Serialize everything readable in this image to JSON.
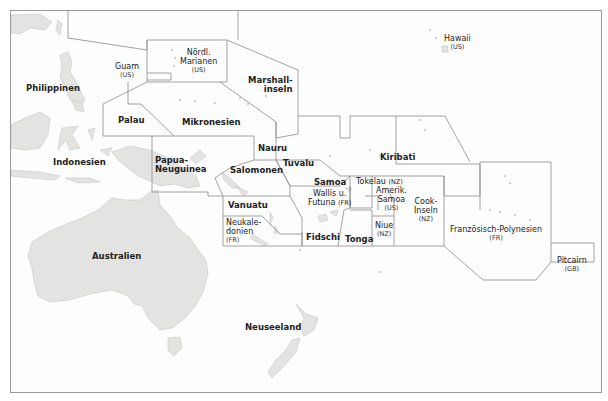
{
  "map": {
    "title": "Ozeanien",
    "colors": {
      "land": "#e3e3e1",
      "land_stroke": "#c8c8c6",
      "border": "#8c8c8c",
      "sea": "#fdfdfd",
      "text": "#222222"
    },
    "labels": {
      "hawaii": {
        "name": "Hawaii",
        "owner": "(US)"
      },
      "guam": {
        "name": "Guam",
        "owner": "(US)"
      },
      "marianen": {
        "name": "Nördl. Marianen",
        "line1": "Nördl.",
        "line2": "Marianen",
        "owner": "(US)"
      },
      "marshall": {
        "name": "Marshallinseln",
        "line1": "Marshall-",
        "line2": "inseln"
      },
      "philippinen": {
        "name": "Philippinen"
      },
      "palau": {
        "name": "Palau"
      },
      "mikronesien": {
        "name": "Mikronesien"
      },
      "nauru": {
        "name": "Nauru"
      },
      "kiribati": {
        "name": "Kiribati"
      },
      "indonesien": {
        "name": "Indonesien"
      },
      "papua": {
        "name": "Papua-Neuguinea",
        "line1": "Papua-",
        "line2": "Neuguinea"
      },
      "salomonen": {
        "name": "Salomonen"
      },
      "tuvalu": {
        "name": "Tuvalu"
      },
      "samoa": {
        "name": "Samoa"
      },
      "tokelau": {
        "name": "Tokelau",
        "owner": "(NZ)"
      },
      "wallis": {
        "name": "Wallis u. Futuna",
        "line1": "Wallis u.",
        "line2": "Futuna",
        "owner": "(FR)"
      },
      "amerik_samoa": {
        "name": "Amerik. Samoa",
        "line1": "Amerik.",
        "line2": "Samoa",
        "owner": "(US)"
      },
      "cook": {
        "name": "Cook-Inseln",
        "line1": "Cook-",
        "line2": "Inseln",
        "owner": "(NZ)"
      },
      "vanuatu": {
        "name": "Vanuatu"
      },
      "neukaledonien": {
        "name": "Neukaledonien",
        "line1": "Neukale-",
        "line2": "donien",
        "owner": "(FR)"
      },
      "fidschi": {
        "name": "Fidschi"
      },
      "tonga": {
        "name": "Tonga"
      },
      "niue": {
        "name": "Niue",
        "owner": "(NZ)"
      },
      "franz_polynesien": {
        "name": "Französisch-Polynesien",
        "owner": "(FR)"
      },
      "pitcairn": {
        "name": "Pitcairn",
        "owner": "(GB)"
      },
      "australien": {
        "name": "Australien"
      },
      "neuseeland": {
        "name": "Neuseeland"
      }
    }
  }
}
